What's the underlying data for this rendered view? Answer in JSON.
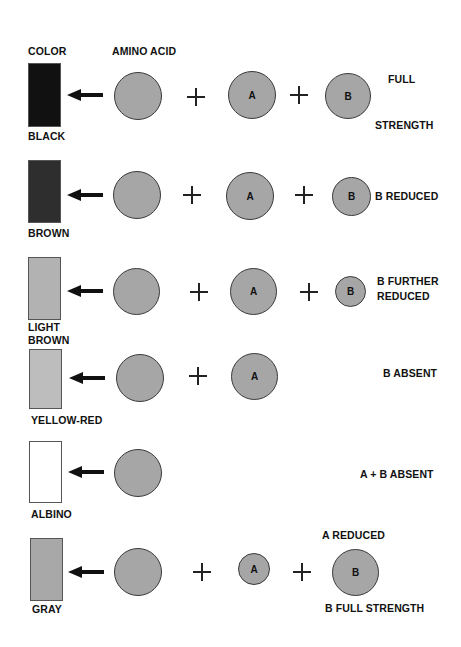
{
  "headers": {
    "color": "COLOR",
    "amino_acid": "AMINO ACID"
  },
  "colors": {
    "black": "#111111",
    "brown": "#2e2e2e",
    "light_brown": "#b2b2b2",
    "yellow_red": "#bdbdbd",
    "albino": "#ffffff",
    "gray": "#a8a8a8",
    "circle_fill": "#a6a6a6"
  },
  "rows": [
    {
      "color_label": "BLACK",
      "a": "A",
      "b": "B",
      "note1": "FULL",
      "note2": "STRENGTH"
    },
    {
      "color_label": "BROWN",
      "a": "A",
      "b": "B",
      "note1": "B  REDUCED"
    },
    {
      "color_label1": "LIGHT",
      "color_label2": "BROWN",
      "a": "A",
      "b": "B",
      "note1": "B  FURTHER",
      "note2": "REDUCED"
    },
    {
      "color_label": "YELLOW-RED",
      "a": "A",
      "note1": "B  ABSENT"
    },
    {
      "color_label": "ALBINO",
      "note1": "A + B  ABSENT"
    },
    {
      "color_label": "GRAY",
      "a": "A",
      "b": "B",
      "note1": "A REDUCED",
      "note2": "B  FULL  STRENGTH"
    }
  ]
}
